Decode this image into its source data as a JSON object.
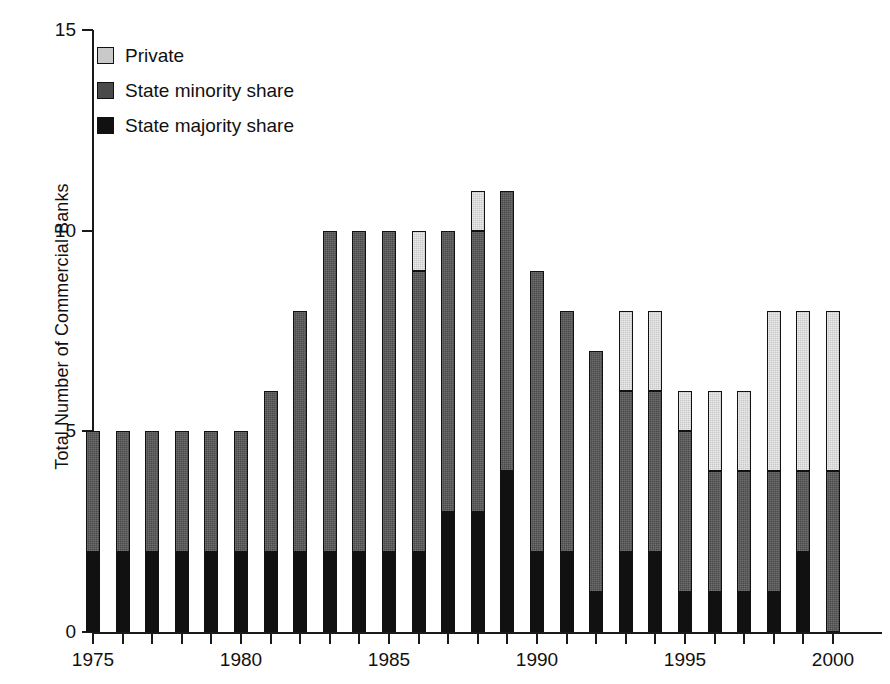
{
  "chart_data": {
    "type": "bar",
    "stacked": true,
    "title": "",
    "xlabel": "",
    "ylabel": "Total Number of Commercial Banks",
    "ylim": [
      0,
      15
    ],
    "yticks": [
      0,
      5,
      10,
      15
    ],
    "ytick_labels": [
      "0",
      "5",
      "10",
      "15"
    ],
    "xlim": [
      1975,
      2000
    ],
    "xticks": [
      1975,
      1976,
      1977,
      1978,
      1979,
      1980,
      1981,
      1982,
      1983,
      1984,
      1985,
      1986,
      1987,
      1988,
      1989,
      1990,
      1991,
      1992,
      1993,
      1994,
      1995,
      1996,
      1997,
      1998,
      1999,
      2000
    ],
    "xtick_labels_shown": [
      "1975",
      "1980",
      "1985",
      "1990",
      "1995",
      "2000"
    ],
    "grid": false,
    "legend_position": "top-left",
    "categories": [
      1975,
      1976,
      1977,
      1978,
      1979,
      1980,
      1981,
      1982,
      1983,
      1984,
      1985,
      1986,
      1987,
      1988,
      1989,
      1990,
      1991,
      1992,
      1993,
      1994,
      1995,
      1996,
      1997,
      1998,
      1999,
      2000
    ],
    "series": [
      {
        "name": "State majority share",
        "color": "#111111",
        "values": [
          2,
          2,
          2,
          2,
          2,
          2,
          2,
          2,
          2,
          2,
          2,
          2,
          3,
          3,
          4,
          2,
          2,
          1,
          2,
          2,
          1,
          1,
          1,
          1,
          2,
          0
        ]
      },
      {
        "name": "State minority share",
        "color": "#4a4a4a",
        "values": [
          3,
          3,
          3,
          3,
          3,
          3,
          4,
          6,
          8,
          8,
          8,
          7,
          7,
          7,
          7,
          7,
          6,
          6,
          4,
          4,
          4,
          3,
          3,
          3,
          2,
          4
        ]
      },
      {
        "name": "Private",
        "color": "#c9c9c9",
        "values": [
          0,
          0,
          0,
          0,
          0,
          0,
          0,
          0,
          0,
          0,
          0,
          1,
          0,
          1,
          0,
          0,
          0,
          0,
          2,
          2,
          1,
          2,
          2,
          4,
          4,
          4
        ]
      }
    ],
    "totals": [
      5,
      5,
      5,
      5,
      5,
      5,
      6,
      8,
      10,
      10,
      10,
      10,
      10,
      11,
      11,
      9,
      8,
      7,
      8,
      8,
      6,
      6,
      6,
      8,
      8,
      8
    ]
  },
  "legend": {
    "items": [
      {
        "label": "Private",
        "key": "private"
      },
      {
        "label": "State minority share",
        "key": "minority"
      },
      {
        "label": "State majority share",
        "key": "majority"
      }
    ]
  }
}
